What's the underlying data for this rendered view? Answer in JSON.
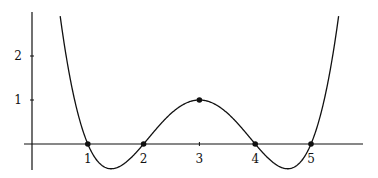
{
  "chart_data": {
    "type": "line",
    "title": "",
    "xlabel": "",
    "ylabel": "",
    "function": "f(x) = 0.25 (x-1)(x-2)(x-4)(x-5)",
    "x_ticks": [
      "1",
      "2",
      "3",
      "4",
      "5"
    ],
    "y_ticks": [
      "1",
      "2"
    ],
    "xlim": [
      -0.15,
      5.9
    ],
    "ylim": [
      -0.6,
      3.0
    ],
    "grid": false,
    "legend": null,
    "marked_points": [
      {
        "x": 1,
        "y": 0
      },
      {
        "x": 2,
        "y": 0
      },
      {
        "x": 3,
        "y": 1
      },
      {
        "x": 4,
        "y": 0
      },
      {
        "x": 5,
        "y": 0
      }
    ],
    "series": [
      {
        "name": "f(x)",
        "x": [
          0.5,
          1,
          1.4,
          2,
          2.5,
          3,
          3.5,
          4,
          4.6,
          5,
          5.5
        ],
        "values": [
          2.95,
          0,
          -0.56,
          0,
          0.61,
          1,
          0.61,
          0,
          -0.56,
          0,
          2.95
        ]
      }
    ]
  },
  "colors": {
    "stroke": "#111111",
    "background": "#ffffff"
  }
}
